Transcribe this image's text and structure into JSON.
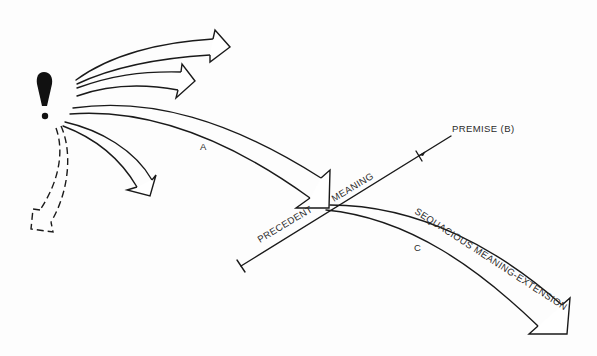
{
  "diagram": {
    "labels": {
      "premise": "PREMISE (B)",
      "meaning": "MEANING",
      "precedent": "PRECEDENT",
      "extension": "SEQUACIOUS MEANING-EXTENSION",
      "arrow_a": "A",
      "arrow_c": "C"
    },
    "icons": {
      "source": "exclamation-icon"
    },
    "colors": {
      "ink": "#1a1a1a",
      "background": "#fdfdfd"
    }
  }
}
